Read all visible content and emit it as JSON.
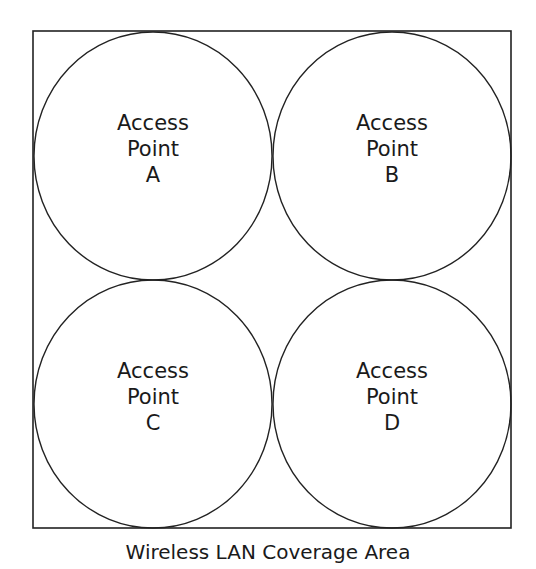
{
  "diagram": {
    "caption": "Wireless LAN Coverage Area",
    "stroke_color": "#222222",
    "coverage_area": {
      "x": 33,
      "y": 31,
      "width": 478,
      "height": 497
    },
    "access_points": [
      {
        "line1": "Access",
        "line2": "Point",
        "id": "A",
        "cx": 153,
        "cy": 156,
        "rx": 119,
        "ry": 124
      },
      {
        "line1": "Access",
        "line2": "Point",
        "id": "B",
        "cx": 392,
        "cy": 156,
        "rx": 119,
        "ry": 124
      },
      {
        "line1": "Access",
        "line2": "Point",
        "id": "C",
        "cx": 153,
        "cy": 404,
        "rx": 119,
        "ry": 124
      },
      {
        "line1": "Access",
        "line2": "Point",
        "id": "D",
        "cx": 392,
        "cy": 404,
        "rx": 119,
        "ry": 124
      }
    ]
  }
}
